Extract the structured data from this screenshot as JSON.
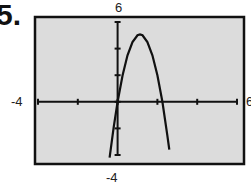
{
  "problem_number": "5.",
  "chart_data": {
    "type": "line",
    "title": "",
    "xlabel": "",
    "ylabel": "",
    "xlim": [
      -4,
      6
    ],
    "ylim": [
      -4,
      6
    ],
    "xtick_step": 2,
    "ytick_step": 2,
    "grid": false,
    "window_labels": {
      "xmin": "-4",
      "xmax": "6",
      "ymin": "-4",
      "ymax": "6"
    },
    "series": [
      {
        "name": "parabola",
        "description": "downward-opening parabola, zeros near x=0 and x≈2.2, vertex near (1.1, 5)",
        "x": [
          -0.4,
          -0.2,
          0,
          0.25,
          0.5,
          0.75,
          1.0,
          1.125,
          1.25,
          1.5,
          1.75,
          2.0,
          2.25,
          2.5,
          2.6
        ],
        "y": [
          -4.2,
          -1.96,
          0,
          2.0,
          3.5,
          4.5,
          5.0,
          5.06,
          5.0,
          4.5,
          3.5,
          2.0,
          0,
          -2.5,
          -3.6
        ]
      }
    ]
  }
}
